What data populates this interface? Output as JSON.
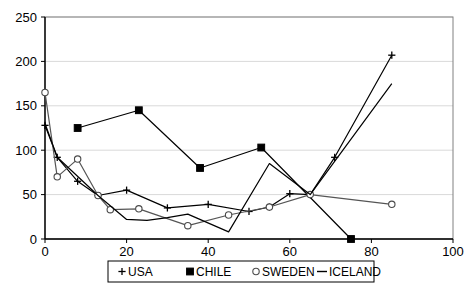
{
  "chart_data": {
    "type": "line",
    "title": "",
    "xlabel": "",
    "ylabel": "",
    "xlim": [
      0,
      100
    ],
    "ylim": [
      0,
      250
    ],
    "xticks": [
      0,
      20,
      40,
      60,
      80,
      100
    ],
    "yticks": [
      0,
      50,
      100,
      150,
      200,
      250
    ],
    "xtick_labels": [
      "0",
      "20",
      "40",
      "60",
      "80",
      "100"
    ],
    "ytick_labels": [
      "0",
      "50",
      "100",
      "150",
      "200",
      "250"
    ],
    "grid": "horizontal",
    "legend_position": "bottom",
    "series": [
      {
        "name": "USA",
        "marker": "plus",
        "color": "#000000",
        "points": [
          {
            "x": 0,
            "y": 128
          },
          {
            "x": 3,
            "y": 92
          },
          {
            "x": 8,
            "y": 65
          },
          {
            "x": 13,
            "y": 49
          },
          {
            "x": 20,
            "y": 55
          },
          {
            "x": 30,
            "y": 35
          },
          {
            "x": 40,
            "y": 39
          },
          {
            "x": 50,
            "y": 31
          },
          {
            "x": 55,
            "y": 36
          },
          {
            "x": 60,
            "y": 51
          },
          {
            "x": 65,
            "y": 50
          },
          {
            "x": 71,
            "y": 92
          },
          {
            "x": 85,
            "y": 207
          }
        ]
      },
      {
        "name": "CHILE",
        "marker": "square",
        "color": "#000000",
        "points": [
          {
            "x": 8,
            "y": 125
          },
          {
            "x": 23,
            "y": 145
          },
          {
            "x": 38,
            "y": 80
          },
          {
            "x": 53,
            "y": 103
          },
          {
            "x": 75,
            "y": 0
          }
        ]
      },
      {
        "name": "SWEDEN",
        "marker": "circle",
        "color": "#555555",
        "points": [
          {
            "x": 0,
            "y": 165
          },
          {
            "x": 3,
            "y": 70
          },
          {
            "x": 8,
            "y": 90
          },
          {
            "x": 13,
            "y": 49
          },
          {
            "x": 16,
            "y": 33
          },
          {
            "x": 23,
            "y": 34
          },
          {
            "x": 35,
            "y": 15
          },
          {
            "x": 45,
            "y": 27
          },
          {
            "x": 55,
            "y": 36
          },
          {
            "x": 65,
            "y": 50
          },
          {
            "x": 85,
            "y": 39
          }
        ]
      },
      {
        "name": "ICELAND",
        "marker": "none",
        "color": "#000000",
        "points": [
          {
            "x": 0,
            "y": 130
          },
          {
            "x": 3,
            "y": 92
          },
          {
            "x": 13,
            "y": 49
          },
          {
            "x": 20,
            "y": 22
          },
          {
            "x": 25,
            "y": 21
          },
          {
            "x": 30,
            "y": 24
          },
          {
            "x": 35,
            "y": 28
          },
          {
            "x": 45,
            "y": 8
          },
          {
            "x": 55,
            "y": 85
          },
          {
            "x": 65,
            "y": 50
          },
          {
            "x": 85,
            "y": 175
          }
        ]
      }
    ]
  },
  "legend": {
    "items": [
      {
        "label": "USA",
        "marker": "plus-marker"
      },
      {
        "label": "CHILE",
        "marker": "square-marker"
      },
      {
        "label": "SWEDEN",
        "marker": "circle-marker"
      },
      {
        "label": "ICELAND",
        "marker": "line-marker"
      }
    ]
  }
}
